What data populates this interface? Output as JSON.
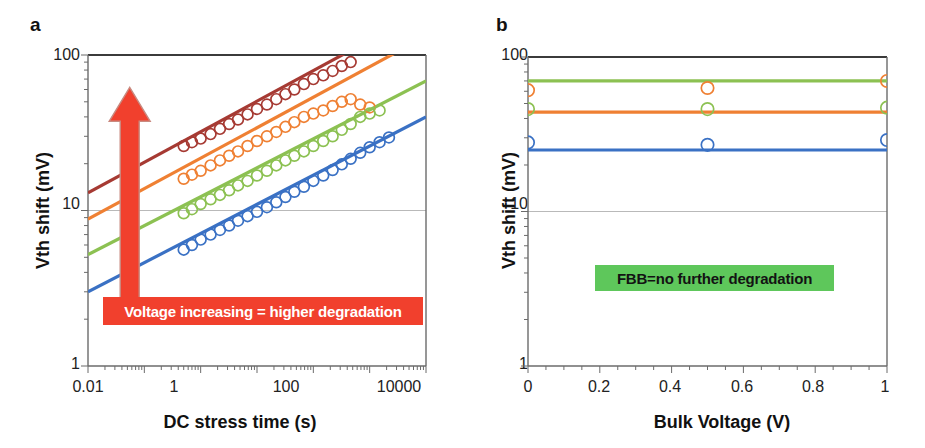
{
  "figure": {
    "background": "#ffffff",
    "width": 925,
    "height": 448
  },
  "panels": [
    {
      "letter": "a",
      "callout": {
        "text": "Voltage increasing = higher degradation",
        "background": "#f1402d",
        "color": "#ffffff"
      },
      "arrow": {
        "name": "voltage-increasing-arrow",
        "direction": "up",
        "color": "#f1402d"
      }
    },
    {
      "letter": "b",
      "callout": {
        "text": "FBB=no further degradation",
        "background": "#5ec75b",
        "color": "#131313"
      }
    }
  ],
  "chart_data": [
    {
      "panel": "a",
      "type": "scatter",
      "title": "",
      "xlabel": "DC stress time (s)",
      "ylabel": "Vth shift (mV)",
      "xscale": "log",
      "yscale": "log",
      "xlim": [
        0.01,
        10000
      ],
      "ylim": [
        1,
        100
      ],
      "xticks": [
        0.01,
        1,
        100,
        10000
      ],
      "xticklabels": [
        "0.01",
        "1",
        "100",
        "10000"
      ],
      "yticks": [
        1,
        10,
        100
      ],
      "yticklabels": [
        "1",
        "10",
        "100"
      ],
      "grid": "y-major-only",
      "annotations": [
        "Voltage increasing = higher degradation"
      ],
      "series": [
        {
          "name": "highest-voltage",
          "color": "#a63a33",
          "fit_line": {
            "x": [
              0.01,
              10000
            ],
            "y": [
              13.0,
              196.0
            ]
          },
          "points_x": [
            0.5,
            0.7,
            1.0,
            1.5,
            2.2,
            3.2,
            4.6,
            6.8,
            10,
            15,
            22,
            32,
            46,
            68,
            100,
            150,
            220,
            320,
            460
          ],
          "points_y": [
            26,
            27.5,
            29,
            31,
            33.5,
            36,
            38.5,
            41.5,
            45,
            48,
            52,
            56,
            60,
            65,
            70,
            74,
            79,
            85,
            90
          ]
        },
        {
          "name": "high-voltage",
          "color": "#ef8033",
          "fit_line": {
            "x": [
              0.01,
              10000
            ],
            "y": [
              8.8,
              132.0
            ]
          },
          "points_x": [
            0.5,
            0.7,
            1.0,
            1.5,
            2.2,
            3.2,
            4.6,
            6.8,
            10,
            15,
            22,
            32,
            46,
            68,
            100,
            150,
            220,
            320,
            460,
            680,
            1000
          ],
          "points_y": [
            16,
            17,
            18,
            19.5,
            21,
            22.5,
            24,
            26,
            28,
            30,
            32,
            34.5,
            37,
            40,
            42,
            44,
            47,
            50,
            52,
            48,
            46
          ]
        },
        {
          "name": "mid-voltage",
          "color": "#8cc152",
          "fit_line": {
            "x": [
              0.01,
              10000
            ],
            "y": [
              5.2,
              68.0
            ]
          },
          "points_x": [
            0.5,
            0.7,
            1.0,
            1.5,
            2.2,
            3.2,
            4.6,
            6.8,
            10,
            15,
            22,
            32,
            46,
            68,
            100,
            150,
            220,
            320,
            460,
            680,
            1000,
            1500
          ],
          "points_y": [
            9.6,
            10.2,
            11,
            11.8,
            12.6,
            13.5,
            14.5,
            15.5,
            16.8,
            18,
            19.5,
            21,
            22.5,
            24,
            26,
            28,
            30,
            33,
            36,
            40,
            42,
            44
          ]
        },
        {
          "name": "low-voltage",
          "color": "#3a71c4",
          "fit_line": {
            "x": [
              0.01,
              10000
            ],
            "y": [
              3.0,
              40.0
            ]
          },
          "points_x": [
            0.5,
            0.7,
            1.0,
            1.5,
            2.2,
            3.2,
            4.6,
            6.8,
            10,
            15,
            22,
            32,
            46,
            68,
            100,
            150,
            220,
            320,
            460,
            680,
            1000,
            1500,
            2200
          ],
          "points_y": [
            5.6,
            6.0,
            6.5,
            7.0,
            7.5,
            8.0,
            8.6,
            9.2,
            9.8,
            10.5,
            11.3,
            12.2,
            13.2,
            14.2,
            15.5,
            16.8,
            18.2,
            19.8,
            21.5,
            23.5,
            25.5,
            27.5,
            29.5
          ]
        }
      ]
    },
    {
      "panel": "b",
      "type": "scatter",
      "title": "",
      "xlabel": "Bulk Voltage (V)",
      "ylabel": "Vth shift (mV)",
      "xscale": "linear",
      "yscale": "log",
      "xlim": [
        0,
        1
      ],
      "ylim": [
        1,
        100
      ],
      "xticks": [
        0,
        0.2,
        0.4,
        0.6,
        0.8,
        1
      ],
      "xticklabels": [
        "0",
        "0.2",
        "0.4",
        "0.6",
        "0.8",
        "1"
      ],
      "yticks": [
        1,
        10,
        100
      ],
      "yticklabels": [
        "1",
        "10",
        "100"
      ],
      "grid": "y-major-only",
      "annotations": [
        "FBB=no further degradation"
      ],
      "series": [
        {
          "name": "flat-green-line",
          "color": "#8cc152",
          "fit_line": {
            "x": [
              0,
              1
            ],
            "y": [
              70,
              70
            ]
          },
          "points_x": [],
          "points_y": []
        },
        {
          "name": "flat-orange-line",
          "color": "#ef8033",
          "fit_line": {
            "x": [
              0,
              1
            ],
            "y": [
              44,
              44
            ]
          },
          "points_x": [],
          "points_y": []
        },
        {
          "name": "flat-blue-line",
          "color": "#3a71c4",
          "fit_line": {
            "x": [
              0,
              1
            ],
            "y": [
              25,
              25
            ]
          },
          "points_x": [],
          "points_y": []
        },
        {
          "name": "orange-markers",
          "color": "#ef8033",
          "points_x": [
            0,
            0.5,
            1
          ],
          "points_y": [
            61,
            63,
            70
          ]
        },
        {
          "name": "green-markers",
          "color": "#8cc152",
          "points_x": [
            0,
            0.5,
            1
          ],
          "points_y": [
            46,
            46,
            47
          ]
        },
        {
          "name": "blue-markers",
          "color": "#3a71c4",
          "points_x": [
            0,
            0.5,
            1
          ],
          "points_y": [
            28,
            27,
            29
          ]
        }
      ]
    }
  ]
}
